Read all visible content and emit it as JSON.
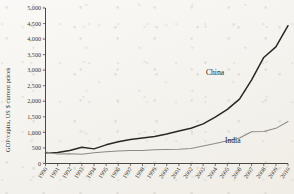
{
  "chart_data": {
    "type": "line",
    "title": "",
    "subtitle": "",
    "xlabel": "",
    "ylabel": "GDP/capita, US $ current prices",
    "xlim": [
      1990,
      2010
    ],
    "ylim": [
      0,
      5000
    ],
    "grid": false,
    "legend_position": "inline-annotation",
    "x": [
      1990,
      1991,
      1992,
      1993,
      1994,
      1995,
      1996,
      1997,
      1998,
      1999,
      2000,
      2001,
      2002,
      2003,
      2004,
      2005,
      2006,
      2007,
      2008,
      2009,
      2010
    ],
    "x_tick_labels": [
      "1990",
      "1991",
      "1992",
      "1993",
      "1994",
      "1995",
      "1996",
      "1997",
      "1998",
      "1999",
      "2000",
      "2001",
      "2002",
      "2003",
      "2004",
      "2005",
      "2006",
      "2007",
      "2008",
      "2009",
      "2010"
    ],
    "y_tick_values": [
      0,
      500,
      1000,
      1500,
      2000,
      2500,
      3000,
      3500,
      4000,
      4500,
      5000
    ],
    "y_tick_labels": [
      "0",
      "500",
      "1,000",
      "1,500",
      "2,000",
      "2,500",
      "3,000",
      "3,500",
      "4,000",
      "4,500",
      "5,000"
    ],
    "series": [
      {
        "name": "China",
        "color": "#2b2724",
        "annotation": "China",
        "values": [
          345,
          355,
          420,
          520,
          470,
          600,
          700,
          775,
          820,
          865,
          950,
          1045,
          1135,
          1275,
          1490,
          1740,
          2070,
          2690,
          3410,
          3750,
          4430
        ]
      },
      {
        "name": "India",
        "color": "#8d8a84",
        "annotation": "India",
        "values": [
          370,
          305,
          315,
          300,
          345,
          375,
          405,
          420,
          415,
          445,
          450,
          460,
          480,
          560,
          640,
          730,
          820,
          1020,
          1030,
          1130,
          1350
        ]
      }
    ]
  }
}
